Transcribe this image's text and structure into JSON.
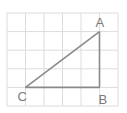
{
  "diagram": {
    "type": "geometry-grid-triangle",
    "grid": {
      "columns": 6,
      "rows": 5
    },
    "vertices": [
      {
        "label": "A",
        "col": 5,
        "row": 1
      },
      {
        "label": "B",
        "col": 5,
        "row": 4
      },
      {
        "label": "C",
        "col": 1,
        "row": 4
      }
    ],
    "sides": [
      [
        "A",
        "B"
      ],
      [
        "B",
        "C"
      ],
      [
        "C",
        "A"
      ]
    ],
    "colors": {
      "grid": "#dcdcdc",
      "triangle": "#8a8a8a",
      "labels": "#7a7a7a"
    }
  }
}
